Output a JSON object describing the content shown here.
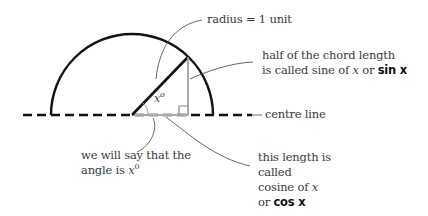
{
  "diagram": {
    "labels": {
      "radius": "radius = 1 unit",
      "sine_line1": "half of the chord length",
      "sine_line2_prefix": "is called sine of ",
      "sine_var": "x",
      "sine_or": " or ",
      "sine_bold": "sin x",
      "centre_line": "centre line",
      "angle_line1": "we will say that the",
      "angle_line2_prefix": "angle is ",
      "angle_var": "x",
      "angle_sup": "0",
      "cos_line1": "this length is",
      "cos_line2": "called",
      "cos_line3_prefix": "cosine of ",
      "cos_var": "x",
      "cos_line4_prefix": "or ",
      "cos_bold": "cos x",
      "angle_marker_var": "x",
      "angle_marker_sup": "o"
    },
    "geometry": {
      "centre": [
        132,
        115
      ],
      "radius": 81,
      "angle_degrees": 46,
      "centre_line_y": 115,
      "centre_line_x_range": [
        23,
        250
      ]
    },
    "colors": {
      "stroke_main": "#111111",
      "stroke_guide": "#a0a0a0",
      "stroke_leader": "#555555",
      "text": "#3a3a3a"
    }
  }
}
